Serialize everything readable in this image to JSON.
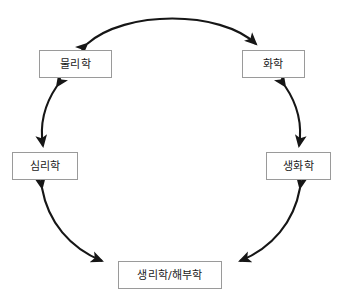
{
  "diagram": {
    "type": "cycle-diagram",
    "background_color": "#ffffff",
    "box_border_color": "#9a9a9a",
    "arrow_color": "#161616",
    "nodes": [
      {
        "id": "physics",
        "label": "물리학",
        "x": 39,
        "y": 50,
        "w": 73,
        "h": 28
      },
      {
        "id": "chemistry",
        "label": "화학",
        "x": 242,
        "y": 50,
        "w": 63,
        "h": 28
      },
      {
        "id": "psychology",
        "label": "심리학",
        "x": 12,
        "y": 152,
        "w": 66,
        "h": 28
      },
      {
        "id": "biochemistry",
        "label": "생화학",
        "x": 266,
        "y": 152,
        "w": 65,
        "h": 28
      },
      {
        "id": "physiology",
        "label": "생리학/해부학",
        "x": 118,
        "y": 261,
        "w": 104,
        "h": 28
      }
    ],
    "connectors": [
      {
        "id": "physics-chemistry",
        "from": "physics",
        "to": "chemistry",
        "style": "double-headed-curve"
      },
      {
        "id": "physics-psychology",
        "from": "physics",
        "to": "psychology",
        "style": "double-headed-curve"
      },
      {
        "id": "chemistry-biochemistry",
        "from": "chemistry",
        "to": "biochemistry",
        "style": "double-headed-curve"
      },
      {
        "id": "psychology-physiology",
        "from": "psychology",
        "to": "physiology",
        "style": "double-headed-curve"
      },
      {
        "id": "biochemistry-physiology",
        "from": "biochemistry",
        "to": "physiology",
        "style": "double-headed-curve"
      }
    ]
  }
}
